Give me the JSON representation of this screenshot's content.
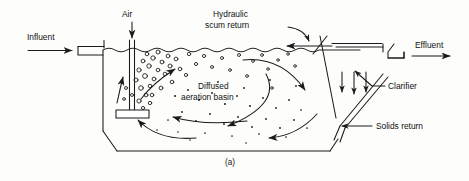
{
  "figure": {
    "caption": "(a)"
  },
  "labels": {
    "influent": "Influent",
    "air": "Air",
    "hydraulic_scum_return_line1": "Hydraulic",
    "hydraulic_scum_return_line2": "scum return",
    "effluent": "Effluent",
    "clarifier": "Clarifier",
    "solids_return": "Solids return",
    "basin_line1": "Diffused",
    "basin_line2": "aeration basin"
  },
  "icons": {
    "influent_arrow": "arrow-right-icon",
    "air_arrow": "arrow-down-icon",
    "effluent_arrow": "arrow-right-icon",
    "scum_return_arrow": "arrow-left-icon",
    "scum_leader": "curved-leader-arrow-icon",
    "clarifier_leader": "leader-line-icon",
    "solids_return_leader": "arrow-left-leader-icon",
    "settling_arrows": "arrow-down-icon",
    "circulation_arrows": "curved-flow-arrow-icon",
    "bubbles": "bubble-icon",
    "floc_particles": "particle-dot-icon",
    "diffuser": "diffuser-plate-icon",
    "inlet_weir": "weir-box-icon",
    "effluent_weir": "weir-launder-icon"
  },
  "colors": {
    "ink": "#1a1a1a",
    "paper": "#fdfdfc"
  },
  "geometry": {
    "water_surface_y": 50,
    "tank_bottom_y": 151,
    "tank_left_x": 103,
    "tank_right_x": 338
  }
}
